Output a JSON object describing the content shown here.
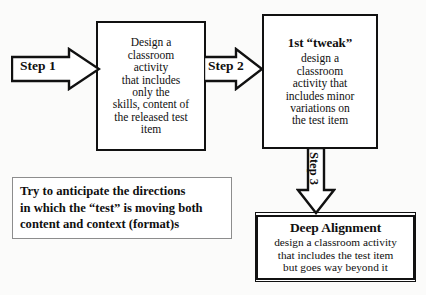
{
  "diagram": {
    "background_color": "#fbfbfa",
    "ink_color": "#111111"
  },
  "steps": [
    {
      "id": "step1",
      "label": "Step 1",
      "direction": "right"
    },
    {
      "id": "step2",
      "label": "Step 2",
      "direction": "right"
    },
    {
      "id": "step3",
      "label": "Step 3",
      "direction": "down"
    }
  ],
  "boxes": {
    "design": {
      "lines": [
        "Design a",
        "classroom",
        "activity",
        "that includes",
        "only the",
        "skills, content of",
        "the released test",
        "item"
      ]
    },
    "tweak": {
      "title": "1st “tweak”",
      "lines": [
        "design a",
        "classroom",
        "activity that",
        "includes minor",
        "variations on",
        "the test item"
      ]
    },
    "deep": {
      "title": "Deep Alignment",
      "lines": [
        "design a classroom activity",
        "that includes the test item",
        "but goes way beyond it"
      ]
    }
  },
  "note": {
    "lines": [
      "Try to anticipate the directions",
      "in which the “test” is moving both",
      "content and context (format)s"
    ]
  }
}
